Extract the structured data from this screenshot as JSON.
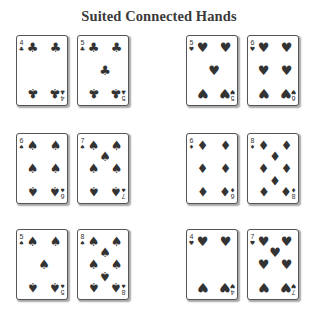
{
  "title": "Suited Connected Hands",
  "suit_symbols": {
    "clubs": "♣",
    "hearts": "♥",
    "spades": "♠",
    "diamonds": "♦"
  },
  "pip_color": "#333333",
  "hands": [
    {
      "name": "four-five-clubs",
      "cards": [
        {
          "rank": "4",
          "suit": "clubs"
        },
        {
          "rank": "5",
          "suit": "clubs"
        }
      ]
    },
    {
      "name": "five-six-hearts",
      "cards": [
        {
          "rank": "5",
          "suit": "hearts"
        },
        {
          "rank": "6",
          "suit": "hearts"
        }
      ]
    },
    {
      "name": "six-seven-spades",
      "cards": [
        {
          "rank": "6",
          "suit": "spades"
        },
        {
          "rank": "7",
          "suit": "spades"
        }
      ]
    },
    {
      "name": "six-eight-diamonds",
      "cards": [
        {
          "rank": "6",
          "suit": "diamonds"
        },
        {
          "rank": "8",
          "suit": "diamonds"
        }
      ]
    },
    {
      "name": "five-eight-spades",
      "cards": [
        {
          "rank": "5",
          "suit": "spades"
        },
        {
          "rank": "8",
          "suit": "spades"
        }
      ]
    },
    {
      "name": "four-seven-hearts",
      "cards": [
        {
          "rank": "4",
          "suit": "hearts"
        },
        {
          "rank": "7",
          "suit": "hearts"
        }
      ]
    }
  ]
}
